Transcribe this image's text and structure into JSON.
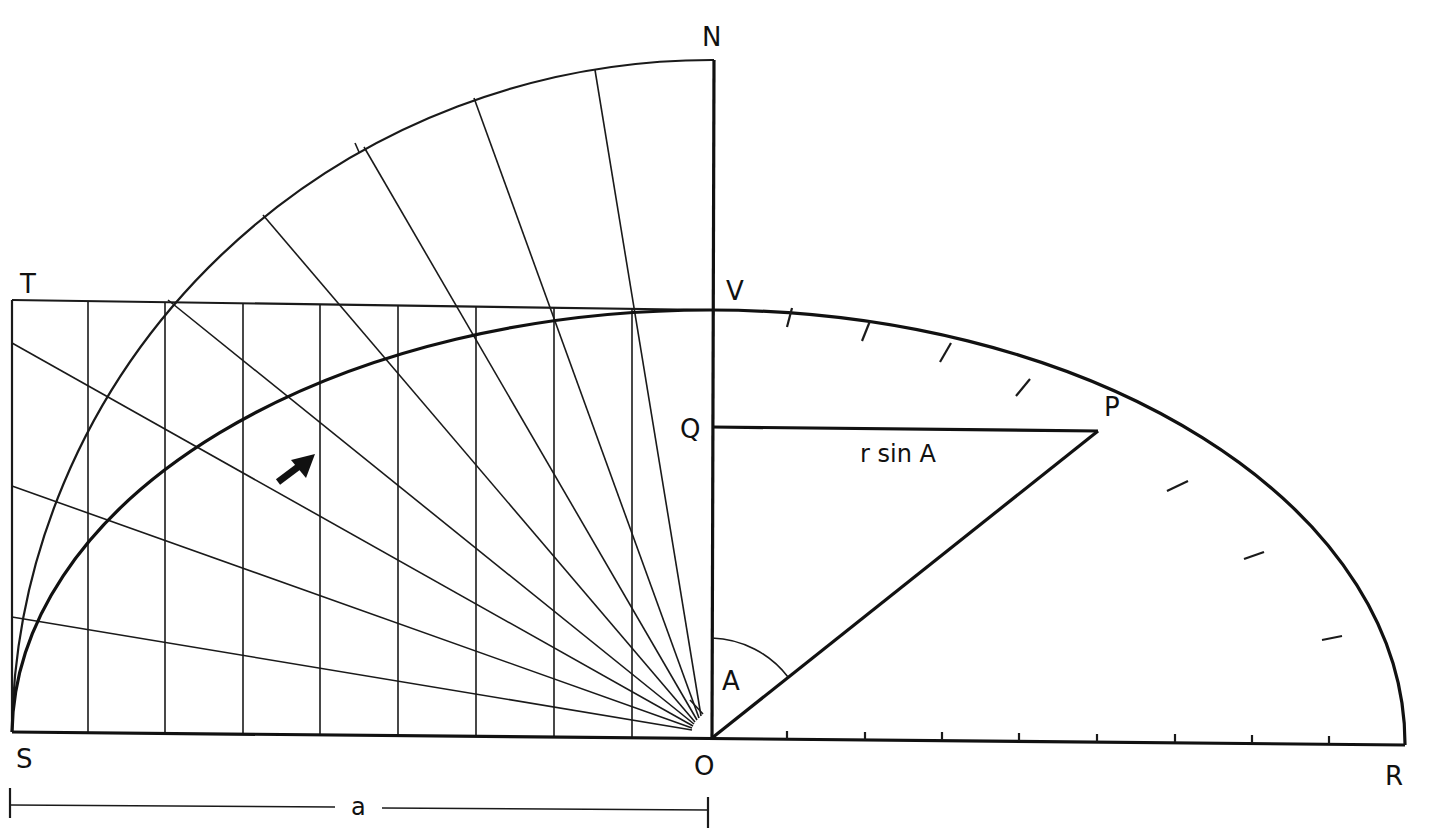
{
  "diagram": {
    "type": "geometric-construction",
    "labels": {
      "N": "N",
      "T": "T",
      "V": "V",
      "Q": "Q",
      "P": "P",
      "A_angle": "A",
      "S": "S",
      "O": "O",
      "R": "R",
      "r_sin_A": "r sin A",
      "a_dimension": "a"
    },
    "points": {
      "O": [
        710,
        738
      ],
      "S": [
        12,
        732
      ],
      "R": [
        1405,
        745
      ],
      "N": [
        714,
        60
      ],
      "V": [
        712,
        310
      ],
      "T": [
        12,
        300
      ],
      "Q": [
        712,
        428
      ],
      "P": [
        1098,
        430
      ]
    },
    "vertical_grid_x": [
      12,
      88,
      165,
      243,
      320,
      398,
      476,
      554,
      632,
      710
    ],
    "radial_line_count": 10,
    "ellipse_tick_count": 8,
    "baseline_tick_count": 8,
    "colors": {
      "ink": "#111111",
      "paper": "#ffffff"
    }
  }
}
